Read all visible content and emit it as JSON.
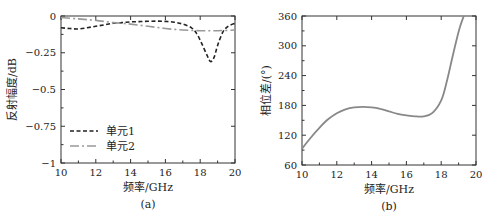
{
  "chart_data": [
    {
      "type": "line",
      "panel_label": "(a)",
      "title": "",
      "xlabel": "频率/GHz",
      "ylabel": "反射幅度/dB",
      "xlim": [
        10,
        20
      ],
      "ylim": [
        -1,
        0
      ],
      "xticks": [
        10,
        12,
        14,
        16,
        18,
        20
      ],
      "xtick_labels": [
        "10",
        "12",
        "14",
        "16",
        "18",
        "20"
      ],
      "yticks": [
        0,
        -0.25,
        -0.5,
        -0.75,
        -1
      ],
      "ytick_labels": [
        "0",
        "−0.25",
        "−0.5",
        "−0.75",
        "−1"
      ],
      "grid": false,
      "legend_position": "lower left",
      "series": [
        {
          "name": "单元1",
          "style": "dashed",
          "color": "#222222",
          "x": [
            10,
            10.5,
            11,
            11.5,
            12,
            12.5,
            13,
            13.5,
            14,
            14.5,
            15,
            15.5,
            16,
            16.5,
            17,
            17.5,
            17.8,
            18.1,
            18.4,
            18.6,
            18.8,
            19.0,
            19.3,
            19.6,
            20
          ],
          "y": [
            -0.08,
            -0.085,
            -0.088,
            -0.08,
            -0.07,
            -0.06,
            -0.05,
            -0.045,
            -0.04,
            -0.038,
            -0.036,
            -0.035,
            -0.037,
            -0.042,
            -0.055,
            -0.08,
            -0.12,
            -0.19,
            -0.27,
            -0.31,
            -0.28,
            -0.2,
            -0.11,
            -0.07,
            -0.05
          ]
        },
        {
          "name": "单元2",
          "style": "dashdot",
          "color": "#999999",
          "x": [
            10,
            11,
            12,
            13,
            13.5,
            14,
            15,
            16,
            17,
            18,
            19,
            20
          ],
          "y": [
            -0.01,
            -0.02,
            -0.03,
            -0.045,
            -0.05,
            -0.055,
            -0.07,
            -0.085,
            -0.095,
            -0.1,
            -0.1,
            -0.095
          ]
        }
      ]
    },
    {
      "type": "line",
      "panel_label": "(b)",
      "title": "",
      "xlabel": "频率/GHz",
      "ylabel": "相位差/(°)",
      "xlim": [
        10,
        20
      ],
      "ylim": [
        60,
        360
      ],
      "xticks": [
        10,
        12,
        14,
        16,
        18,
        20
      ],
      "xtick_labels": [
        "10",
        "12",
        "14",
        "16",
        "18",
        "20"
      ],
      "yticks": [
        60,
        120,
        180,
        240,
        300,
        360
      ],
      "ytick_labels": [
        "60",
        "120",
        "180",
        "240",
        "300",
        "360"
      ],
      "grid": false,
      "series": [
        {
          "name": "相位差",
          "style": "solid",
          "color": "#888888",
          "x": [
            10,
            10.5,
            11,
            11.5,
            12,
            12.5,
            13,
            13.5,
            14,
            14.5,
            15,
            15.5,
            16,
            16.5,
            17,
            17.5,
            18,
            18.3,
            18.6,
            18.9,
            19.1,
            19.3
          ],
          "y": [
            93,
            115,
            135,
            152,
            164,
            172,
            176,
            177,
            176,
            173,
            168,
            163,
            160,
            158,
            158,
            165,
            190,
            225,
            270,
            315,
            340,
            360
          ]
        }
      ]
    }
  ]
}
